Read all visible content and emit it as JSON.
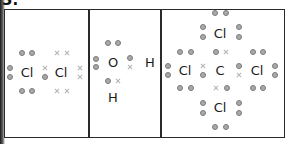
{
  "question_number": "3.",
  "panels": [
    {
      "name": "chlorine-molecule",
      "atoms": [
        {
          "symbol": "Cl",
          "x": 27,
          "y": 72
        },
        {
          "symbol": "Cl",
          "x": 61,
          "y": 72
        }
      ],
      "dots": [
        [
          22,
          53
        ],
        [
          32,
          53
        ],
        [
          10,
          68
        ],
        [
          10,
          77
        ],
        [
          22,
          91
        ],
        [
          32,
          91
        ],
        [
          45,
          77
        ]
      ],
      "crosses": [
        [
          57,
          53
        ],
        [
          67,
          53
        ],
        [
          45,
          68
        ],
        [
          80,
          68
        ],
        [
          80,
          77
        ],
        [
          57,
          91
        ],
        [
          67,
          91
        ]
      ]
    },
    {
      "name": "water-molecule",
      "atoms": [
        {
          "symbol": "O",
          "x": 113,
          "y": 62
        },
        {
          "symbol": "H",
          "x": 150,
          "y": 62
        },
        {
          "symbol": "H",
          "x": 113,
          "y": 97
        }
      ],
      "dots": [
        [
          108,
          43
        ],
        [
          118,
          43
        ],
        [
          96,
          59
        ],
        [
          96,
          67
        ],
        [
          130,
          58
        ],
        [
          108,
          81
        ]
      ],
      "crosses": [
        [
          130,
          67
        ],
        [
          118,
          81
        ]
      ]
    },
    {
      "name": "carbon-tetrachloride-molecule",
      "atoms": [
        {
          "symbol": "Cl",
          "x": 220,
          "y": 33
        },
        {
          "symbol": "Cl",
          "x": 185,
          "y": 70
        },
        {
          "symbol": "C",
          "x": 220,
          "y": 70
        },
        {
          "symbol": "Cl",
          "x": 257,
          "y": 70
        },
        {
          "symbol": "Cl",
          "x": 220,
          "y": 107
        }
      ],
      "dots": [
        [
          215,
          13
        ],
        [
          226,
          13
        ],
        [
          203,
          27
        ],
        [
          203,
          37
        ],
        [
          239,
          27
        ],
        [
          239,
          37
        ],
        [
          180,
          52
        ],
        [
          191,
          52
        ],
        [
          216,
          52
        ],
        [
          253,
          52
        ],
        [
          263,
          52
        ],
        [
          168,
          66
        ],
        [
          168,
          75
        ],
        [
          203,
          75
        ],
        [
          239,
          66
        ],
        [
          275,
          66
        ],
        [
          275,
          75
        ],
        [
          180,
          88
        ],
        [
          191,
          88
        ],
        [
          227,
          88
        ],
        [
          253,
          88
        ],
        [
          263,
          88
        ],
        [
          203,
          103
        ],
        [
          203,
          113
        ],
        [
          239,
          103
        ],
        [
          239,
          113
        ],
        [
          215,
          127
        ],
        [
          226,
          127
        ]
      ],
      "crosses": [
        [
          226,
          52
        ],
        [
          203,
          66
        ],
        [
          239,
          75
        ],
        [
          216,
          88
        ]
      ]
    }
  ]
}
